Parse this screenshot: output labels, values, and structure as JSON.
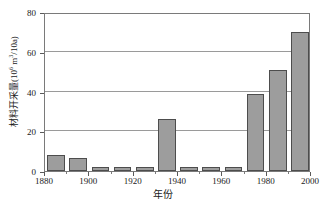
{
  "chart_data": {
    "type": "bar",
    "title": "",
    "xlabel": "年份",
    "ylabel": "材料开采量(10⁶ m³/10a)",
    "ylabel_parts": {
      "prefix": "材料开采量(10",
      "exp1": "6",
      "mid": " m",
      "exp2": "3",
      "suffix": "/10a)"
    },
    "x": [
      1885,
      1895,
      1905,
      1915,
      1925,
      1935,
      1945,
      1955,
      1965,
      1975,
      1985,
      1995
    ],
    "values": [
      8,
      6.5,
      2,
      2,
      1.8,
      26,
      1.8,
      1.8,
      1.8,
      38.5,
      51,
      70
    ],
    "xlim": [
      1880,
      2000
    ],
    "ylim": [
      0,
      80
    ],
    "xticks": [
      1880,
      1900,
      1920,
      1940,
      1960,
      1980,
      2000
    ],
    "xticklabels": [
      "1880",
      "1900",
      "1920",
      "1940",
      "1960",
      "1980",
      "2000"
    ],
    "xticks_minor": [
      1890,
      1910,
      1930,
      1950,
      1970,
      1990
    ],
    "yticks": [
      0,
      20,
      40,
      60,
      80
    ],
    "yticklabels": [
      "0",
      "20",
      "40",
      "60",
      "80"
    ],
    "grid": "horizontal",
    "legend": "none",
    "bar_color": "#9d9d9d",
    "bar_edge_color": "#4d4d4d",
    "grid_color": "#9a9a9a",
    "frame_color": "#7a7a7a",
    "bar_width_years": 8
  }
}
